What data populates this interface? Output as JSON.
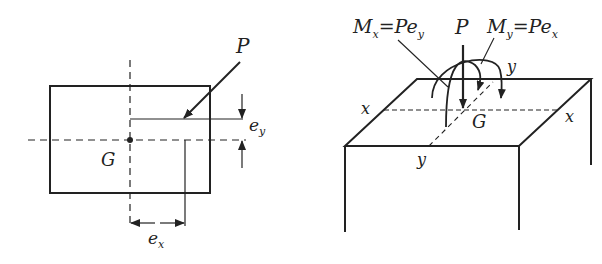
{
  "left_figure": {
    "description": "Plan view of rectangular section with eccentric load P",
    "labels": {
      "load": "P",
      "centroid": "G",
      "ecc_x": "e",
      "ecc_x_sub": "x",
      "ecc_y": "e",
      "ecc_y_sub": "y"
    }
  },
  "right_figure": {
    "description": "3D view of column top with load P and moments Mx, My",
    "labels": {
      "load": "P",
      "centroid": "G",
      "mx_M": "M",
      "mx_sub": "x",
      "mx_eq": "=Pe",
      "mx_eq_sub": "y",
      "my_M": "M",
      "my_sub": "y",
      "my_eq": "=Pe",
      "my_eq_sub": "x",
      "axis_x_left": "x",
      "axis_x_right": "x",
      "axis_y_back": "y",
      "axis_y_front": "y"
    }
  },
  "colors": {
    "stroke": "#222222",
    "background": "#ffffff"
  }
}
